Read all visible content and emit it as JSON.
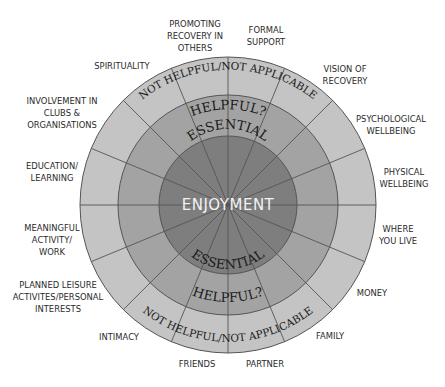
{
  "diagram": {
    "center_label": "ENJOYMENT",
    "rings": [
      {
        "name": "essential",
        "label": "ESSENTIAL",
        "radius": 69,
        "color": "#7e7e7e"
      },
      {
        "name": "helpful",
        "label": "HELPFUL?",
        "radius": 110,
        "color": "#a3a3a3"
      },
      {
        "name": "not-helpful",
        "label": "NOT HELPFUL/NOT APPLICABLE",
        "radius": 148,
        "color": "#c4c4c4"
      }
    ],
    "spoke_color": "#555555",
    "segments": [
      {
        "id": "formal-support",
        "label": "FORMAL\nSUPPORT",
        "x": 266,
        "y": 36
      },
      {
        "id": "vision-of-recovery",
        "label": "VISION OF\nRECOVERY",
        "x": 345,
        "y": 75
      },
      {
        "id": "psychological-wellbeing",
        "label": "PSYCHOLOGICAL\nWELLBEING",
        "x": 391,
        "y": 125
      },
      {
        "id": "physical-wellbeing",
        "label": "PHYSICAL\nWELLBEING",
        "x": 404,
        "y": 178
      },
      {
        "id": "where-you-live",
        "label": "WHERE\nYOU LIVE",
        "x": 398,
        "y": 235
      },
      {
        "id": "money",
        "label": "MONEY",
        "x": 372,
        "y": 293
      },
      {
        "id": "family",
        "label": "FAMILY",
        "x": 330,
        "y": 336
      },
      {
        "id": "partner",
        "label": "PARTNER",
        "x": 265,
        "y": 364
      },
      {
        "id": "friends",
        "label": "FRIENDS",
        "x": 197,
        "y": 364
      },
      {
        "id": "intimacy",
        "label": "INTIMACY",
        "x": 119,
        "y": 337
      },
      {
        "id": "planned-leisure",
        "label": "PLANNED LEISURE\nACTIVITES/PERSONAL\nINTERESTS",
        "x": 58,
        "y": 297
      },
      {
        "id": "meaningful-activity",
        "label": "MEANINGFUL\nACTIVITY/\nWORK",
        "x": 52,
        "y": 240
      },
      {
        "id": "education-learning",
        "label": "EDUCATION/\nLEARNING",
        "x": 52,
        "y": 172
      },
      {
        "id": "involvement-clubs",
        "label": "INVOLVEMENT IN\nCLUBS &\nORGANISATIONS",
        "x": 62,
        "y": 113
      },
      {
        "id": "spirituality",
        "label": "SPIRITUALITY",
        "x": 122,
        "y": 66
      },
      {
        "id": "promoting-recovery",
        "label": "PROMOTING\nRECOVERY IN\nOTHERS",
        "x": 195,
        "y": 36
      }
    ]
  }
}
